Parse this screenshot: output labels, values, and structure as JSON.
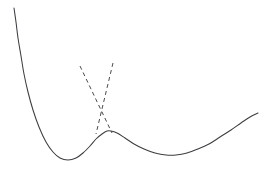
{
  "figure": {
    "title": "",
    "background_color": "#ffffff",
    "width": 272,
    "height": 171
  },
  "chart_data": {
    "type": "line",
    "title": "",
    "subtitle": "",
    "xlabel": "",
    "ylabel": "",
    "xlim": [
      0,
      272
    ],
    "ylim": [
      171,
      0
    ],
    "grid": false,
    "legend": "none",
    "axes_visible": false,
    "tick_labels_x": [],
    "tick_labels_y": [],
    "annotations": [],
    "series": [
      {
        "name": "adiabatic-solid-curve",
        "style": "solid",
        "color": "#3d3d42",
        "linewidth": 1.05,
        "points": [
          [
            14,
            8
          ],
          [
            16,
            22
          ],
          [
            18,
            38
          ],
          [
            21,
            56
          ],
          [
            24,
            74
          ],
          [
            28,
            92
          ],
          [
            33,
            110
          ],
          [
            39,
            127
          ],
          [
            46,
            142
          ],
          [
            53,
            152
          ],
          [
            60,
            158
          ],
          [
            68,
            160
          ],
          [
            76,
            158
          ],
          [
            83,
            153
          ],
          [
            90,
            146
          ],
          [
            96,
            139
          ],
          [
            102,
            134
          ],
          [
            107,
            131
          ],
          [
            111,
            131
          ],
          [
            117,
            133
          ],
          [
            125,
            138
          ],
          [
            134,
            144
          ],
          [
            144,
            149
          ],
          [
            155,
            153
          ],
          [
            166,
            155
          ],
          [
            176,
            155
          ],
          [
            187,
            153
          ],
          [
            198,
            149
          ],
          [
            209,
            144
          ],
          [
            220,
            137
          ],
          [
            231,
            130
          ],
          [
            241,
            123
          ],
          [
            250,
            117
          ],
          [
            258,
            113
          ]
        ]
      },
      {
        "name": "diabatic-dashed-left",
        "style": "dashed",
        "color": "#4a4a50",
        "linewidth": 1.0,
        "dash_pattern": [
          4,
          3.2
        ],
        "points": [
          [
            80,
            66
          ],
          [
            112,
            133
          ]
        ]
      },
      {
        "name": "diabatic-dashed-right",
        "style": "dashed",
        "color": "#4a4a50",
        "linewidth": 1.0,
        "dash_pattern": [
          4,
          3.2
        ],
        "points": [
          [
            113,
            63
          ],
          [
            96,
            134
          ]
        ]
      }
    ],
    "features": {
      "local_minimum_left": [
        68,
        160
      ],
      "local_maximum_center": [
        109,
        131
      ],
      "local_minimum_right": [
        176,
        155
      ],
      "dashed_crossing_point": [
        103,
        118
      ]
    }
  }
}
